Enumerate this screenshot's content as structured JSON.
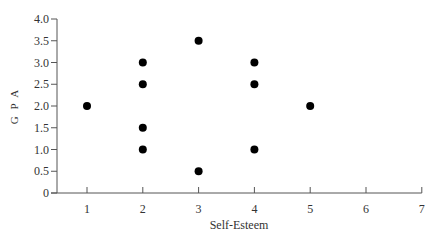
{
  "chart_data": {
    "type": "scatter",
    "title": "",
    "xlabel": "Self-Esteem",
    "ylabel": "G P A",
    "xlim": [
      0.5,
      7
    ],
    "ylim": [
      0,
      4.0
    ],
    "x_ticks": [
      1,
      2,
      3,
      4,
      5,
      6,
      7
    ],
    "y_ticks": [
      "0",
      "0.5",
      "1.0",
      "1.5",
      "2.0",
      "2.5",
      "3.0",
      "3.5",
      "4.0"
    ],
    "grid": false,
    "legend": null,
    "points": [
      {
        "x": 1,
        "y": 2.0
      },
      {
        "x": 2,
        "y": 3.0
      },
      {
        "x": 2,
        "y": 2.5
      },
      {
        "x": 2,
        "y": 1.5
      },
      {
        "x": 2,
        "y": 1.0
      },
      {
        "x": 3,
        "y": 3.5
      },
      {
        "x": 3,
        "y": 0.5
      },
      {
        "x": 4,
        "y": 3.0
      },
      {
        "x": 4,
        "y": 2.5
      },
      {
        "x": 4,
        "y": 1.0
      },
      {
        "x": 5,
        "y": 2.0
      }
    ],
    "marker_color": "#000000",
    "axis_color": "#555555"
  }
}
